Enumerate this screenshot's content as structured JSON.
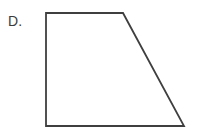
{
  "figure": {
    "label": "D.",
    "shape_name": "trapezoid",
    "background_color": "#ffffff",
    "stroke_color": "#3f3f3f",
    "stroke_width": 1.8,
    "fill_color": "none",
    "canvas": {
      "width": 198,
      "height": 135
    },
    "vertices": [
      {
        "name": "top-left",
        "x": 46,
        "y": 13
      },
      {
        "name": "top-right",
        "x": 123,
        "y": 13
      },
      {
        "name": "bottom-right",
        "x": 184,
        "y": 126
      },
      {
        "name": "bottom-left",
        "x": 46,
        "y": 126
      }
    ],
    "edges": [
      {
        "name": "top-edge",
        "from": "top-left",
        "to": "top-right"
      },
      {
        "name": "right-slanted-edge",
        "from": "top-right",
        "to": "bottom-right"
      },
      {
        "name": "bottom-edge",
        "from": "bottom-right",
        "to": "bottom-left"
      },
      {
        "name": "left-edge",
        "from": "bottom-left",
        "to": "top-left"
      }
    ],
    "polygon_points": "46,13 123,13 184,126 46,126"
  }
}
